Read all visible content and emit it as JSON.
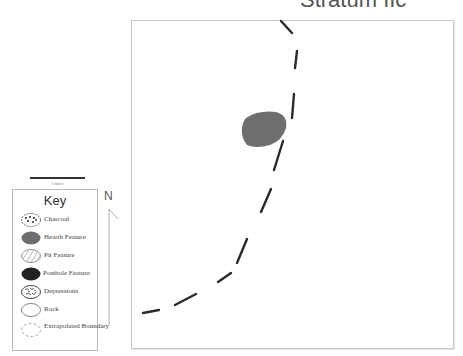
{
  "title": "Stratum IIc",
  "scale": {
    "label": "1 meter"
  },
  "north": {
    "label": "N"
  },
  "legend": {
    "title": "Key",
    "items": [
      {
        "label": "Charcoal",
        "icon": "charcoal-icon"
      },
      {
        "label": "Hearth Feature",
        "icon": "hearth-icon"
      },
      {
        "label": "Pit Feature",
        "icon": "pit-icon"
      },
      {
        "label": "Posthole Feature",
        "icon": "posthole-icon"
      },
      {
        "label": "Depressions",
        "icon": "depressions-icon"
      },
      {
        "label": "Rock",
        "icon": "rock-icon"
      },
      {
        "label": "Extrapolated Boundary",
        "icon": "extrapolated-boundary-icon"
      }
    ]
  },
  "colors": {
    "hearth": "#6e6e6e",
    "posthole": "#222222",
    "boundary": "#2a2a2a",
    "frame": "#c8c8c8"
  },
  "map": {
    "features": [
      {
        "type": "hearth",
        "label": "Hearth Feature"
      },
      {
        "type": "extrapolated-boundary",
        "label": "Extrapolated Boundary"
      }
    ]
  }
}
